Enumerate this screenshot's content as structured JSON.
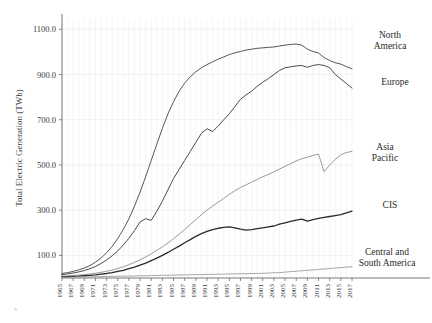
{
  "chart_data": {
    "type": "line",
    "title": "",
    "xlabel": "",
    "ylabel": "Total Electric Generation (TWh)",
    "ylim": [
      0,
      1150
    ],
    "yticks": [
      100.0,
      300.0,
      500.0,
      700.0,
      900.0,
      1100.0
    ],
    "ytick_labels": [
      "100.0",
      "300.0",
      "500.0",
      "700.0",
      "900.0",
      "1100.0"
    ],
    "xlim": [
      1965,
      2017
    ],
    "xticks": [
      1965,
      1967,
      1969,
      1971,
      1973,
      1975,
      1977,
      1979,
      1981,
      1983,
      1985,
      1987,
      1989,
      1991,
      1993,
      1995,
      1997,
      1999,
      2001,
      2003,
      2005,
      2007,
      2009,
      2011,
      2013,
      2015,
      2017
    ],
    "xtick_labels": [
      "1965",
      "1967",
      "1969",
      "1971",
      "1973",
      "1975",
      "1977",
      "1979",
      "1981",
      "1983",
      "1985",
      "1987",
      "1989",
      "1991",
      "1993",
      "1995",
      "1997",
      "1999",
      "2001",
      "2003",
      "2005",
      "2007",
      "2009",
      "2011",
      "2013",
      "2015",
      "2017"
    ],
    "grid": true,
    "grid_axis": "both",
    "legend": "inline-right-labels",
    "x": [
      1965,
      1966,
      1967,
      1968,
      1969,
      1970,
      1971,
      1972,
      1973,
      1974,
      1975,
      1976,
      1977,
      1978,
      1979,
      1980,
      1981,
      1982,
      1983,
      1984,
      1985,
      1986,
      1987,
      1988,
      1989,
      1990,
      1991,
      1992,
      1993,
      1994,
      1995,
      1996,
      1997,
      1998,
      1999,
      2000,
      2001,
      2002,
      2003,
      2004,
      2005,
      2006,
      2007,
      2008,
      2009,
      2010,
      2011,
      2012,
      2013,
      2014,
      2015,
      2016,
      2017
    ],
    "series": [
      {
        "name": "North America",
        "label": "North America",
        "color": "#55565a",
        "width": 1.0,
        "values": [
          20,
          24,
          29,
          36,
          44,
          55,
          70,
          88,
          112,
          140,
          175,
          215,
          262,
          318,
          380,
          448,
          520,
          592,
          662,
          726,
          780,
          826,
          862,
          890,
          912,
          930,
          944,
          956,
          968,
          978,
          988,
          996,
          1002,
          1008,
          1012,
          1016,
          1018,
          1020,
          1022,
          1026,
          1030,
          1033,
          1035,
          1030,
          1012,
          1002,
          995,
          975,
          962,
          952,
          946,
          935,
          925
        ]
      },
      {
        "name": "Europe",
        "label": "Europe",
        "color": "#4a4b4f",
        "width": 1.0,
        "values": [
          15,
          18,
          22,
          27,
          33,
          41,
          51,
          64,
          80,
          98,
          120,
          146,
          176,
          210,
          248,
          262,
          255,
          295,
          340,
          390,
          440,
          480,
          520,
          560,
          600,
          640,
          660,
          648,
          672,
          700,
          726,
          758,
          790,
          810,
          826,
          848,
          866,
          882,
          900,
          918,
          930,
          934,
          938,
          940,
          932,
          940,
          944,
          940,
          930,
          900,
          880,
          860,
          840
        ]
      },
      {
        "name": "Asia Pacific",
        "label": "Asia Pacific",
        "color": "#9a9a9e",
        "width": 1.0,
        "values": [
          8,
          9,
          11,
          13,
          15,
          18,
          21,
          25,
          30,
          35,
          42,
          50,
          59,
          69,
          80,
          93,
          107,
          122,
          138,
          155,
          174,
          194,
          215,
          236,
          258,
          280,
          300,
          318,
          335,
          352,
          370,
          386,
          400,
          412,
          424,
          436,
          448,
          458,
          470,
          482,
          494,
          506,
          518,
          528,
          534,
          542,
          548,
          470,
          500,
          525,
          545,
          555,
          560
        ]
      },
      {
        "name": "CIS",
        "label": "CIS",
        "color": "#2a2a2d",
        "width": 1.3,
        "values": [
          5,
          6,
          7,
          8,
          10,
          12,
          14,
          17,
          20,
          24,
          29,
          34,
          41,
          48,
          57,
          66,
          77,
          88,
          100,
          113,
          127,
          141,
          156,
          170,
          184,
          196,
          206,
          214,
          220,
          224,
          226,
          222,
          216,
          212,
          214,
          218,
          222,
          226,
          230,
          238,
          244,
          250,
          256,
          260,
          252,
          258,
          264,
          268,
          272,
          276,
          280,
          288,
          296
        ]
      },
      {
        "name": "Central and South America",
        "label": "Central and South America",
        "color": "#9d9da1",
        "width": 0.9,
        "values": [
          3,
          3,
          4,
          4,
          5,
          5,
          6,
          6,
          7,
          7,
          8,
          8,
          9,
          9,
          10,
          10,
          11,
          11,
          12,
          12,
          13,
          13,
          14,
          14,
          15,
          15,
          16,
          16,
          17,
          17,
          18,
          18,
          19,
          19,
          20,
          20,
          21,
          22,
          23,
          24,
          26,
          28,
          30,
          32,
          34,
          36,
          38,
          40,
          42,
          44,
          46,
          48,
          50
        ]
      }
    ],
    "annotations": [
      {
        "name": "north-america-label",
        "text": "North America",
        "x": 378,
        "y": 38
      },
      {
        "name": "europe-label",
        "text": "Europe",
        "x": 383,
        "y": 84
      },
      {
        "name": "asia-pacific-label",
        "text": "Asia Pacific",
        "x": 373,
        "y": 150
      },
      {
        "name": "cis-label",
        "text": "CIS",
        "x": 381,
        "y": 207
      },
      {
        "name": "central-south-america-label",
        "text": "Central and South America",
        "x": 362,
        "y": 257
      }
    ],
    "corner_mark": "^"
  },
  "labels": {
    "north_america_line1": "North",
    "north_america_line2": "America",
    "europe": "Europe",
    "asia_line1": "Asia",
    "asia_line2": "Pacific",
    "cis": "CIS",
    "csa_line1": "Central and",
    "csa_line2": "South America"
  }
}
